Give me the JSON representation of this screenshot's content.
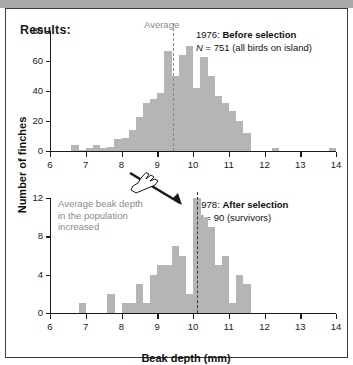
{
  "figure": {
    "results_heading": "Results:",
    "y_axis_title": "Number of finches",
    "x_axis_title": "Beak depth (mm)"
  },
  "annotations": {
    "average_caption": "Average",
    "increase_note": "Average beak depth in the population increased",
    "pointer_icon": "pointing-hand-icon",
    "arrow_icon": "arrow-down-icon"
  },
  "top_panel": {
    "year_label": "1976:",
    "condition_label": "Before selection",
    "n_prefix": "N",
    "n_value": "= 751 (all birds on island)"
  },
  "bottom_panel": {
    "year_label": "1978:",
    "condition_label": "After selection",
    "n_prefix": "N",
    "n_value": "= 90 (survivors)"
  },
  "chart_data": [
    {
      "type": "bar",
      "title": "1976: Before selection",
      "subtitle": "N = 751 (all birds on island)",
      "xlabel": "Beak depth (mm)",
      "ylabel": "Number of finches",
      "xlim": [
        6,
        14
      ],
      "ylim": [
        0,
        80
      ],
      "xticks": [
        6,
        7,
        8,
        9,
        10,
        11,
        12,
        13,
        14
      ],
      "yticks": [
        0,
        20,
        40,
        60,
        80
      ],
      "bin_width": 0.2,
      "grid": false,
      "legend": false,
      "average_line": 9.45,
      "average_label": "Average",
      "bin_starts": [
        6.6,
        6.8,
        7.0,
        7.2,
        7.4,
        7.6,
        7.8,
        8.0,
        8.2,
        8.4,
        8.6,
        8.8,
        9.0,
        9.2,
        9.4,
        9.6,
        9.8,
        10.0,
        10.2,
        10.4,
        10.6,
        10.8,
        11.0,
        11.2,
        11.4,
        12.2,
        13.8
      ],
      "values": [
        4,
        1,
        2,
        4,
        2,
        3,
        8,
        9,
        14,
        23,
        32,
        35,
        39,
        67,
        50,
        64,
        70,
        42,
        63,
        50,
        37,
        32,
        27,
        20,
        12,
        2,
        2
      ]
    },
    {
      "type": "bar",
      "title": "1978: After selection",
      "subtitle": "N = 90 (survivors)",
      "xlabel": "Beak depth (mm)",
      "ylabel": "Number of finches",
      "xlim": [
        6,
        14
      ],
      "ylim": [
        0,
        12
      ],
      "xticks": [
        6,
        7,
        8,
        9,
        10,
        11,
        12,
        13,
        14
      ],
      "yticks": [
        0,
        4,
        8,
        12
      ],
      "bin_width": 0.2,
      "grid": false,
      "legend": false,
      "average_line": 10.1,
      "bin_starts": [
        6.8,
        7.6,
        8.0,
        8.2,
        8.4,
        8.6,
        8.8,
        9.0,
        9.2,
        9.4,
        9.6,
        9.8,
        10.0,
        10.2,
        10.4,
        10.6,
        10.8,
        11.0,
        11.2,
        11.4
      ],
      "values": [
        1,
        2,
        1,
        1,
        3,
        1,
        4,
        5,
        5,
        7,
        6,
        2,
        12,
        10,
        9,
        5,
        6,
        1,
        4,
        3
      ]
    }
  ]
}
